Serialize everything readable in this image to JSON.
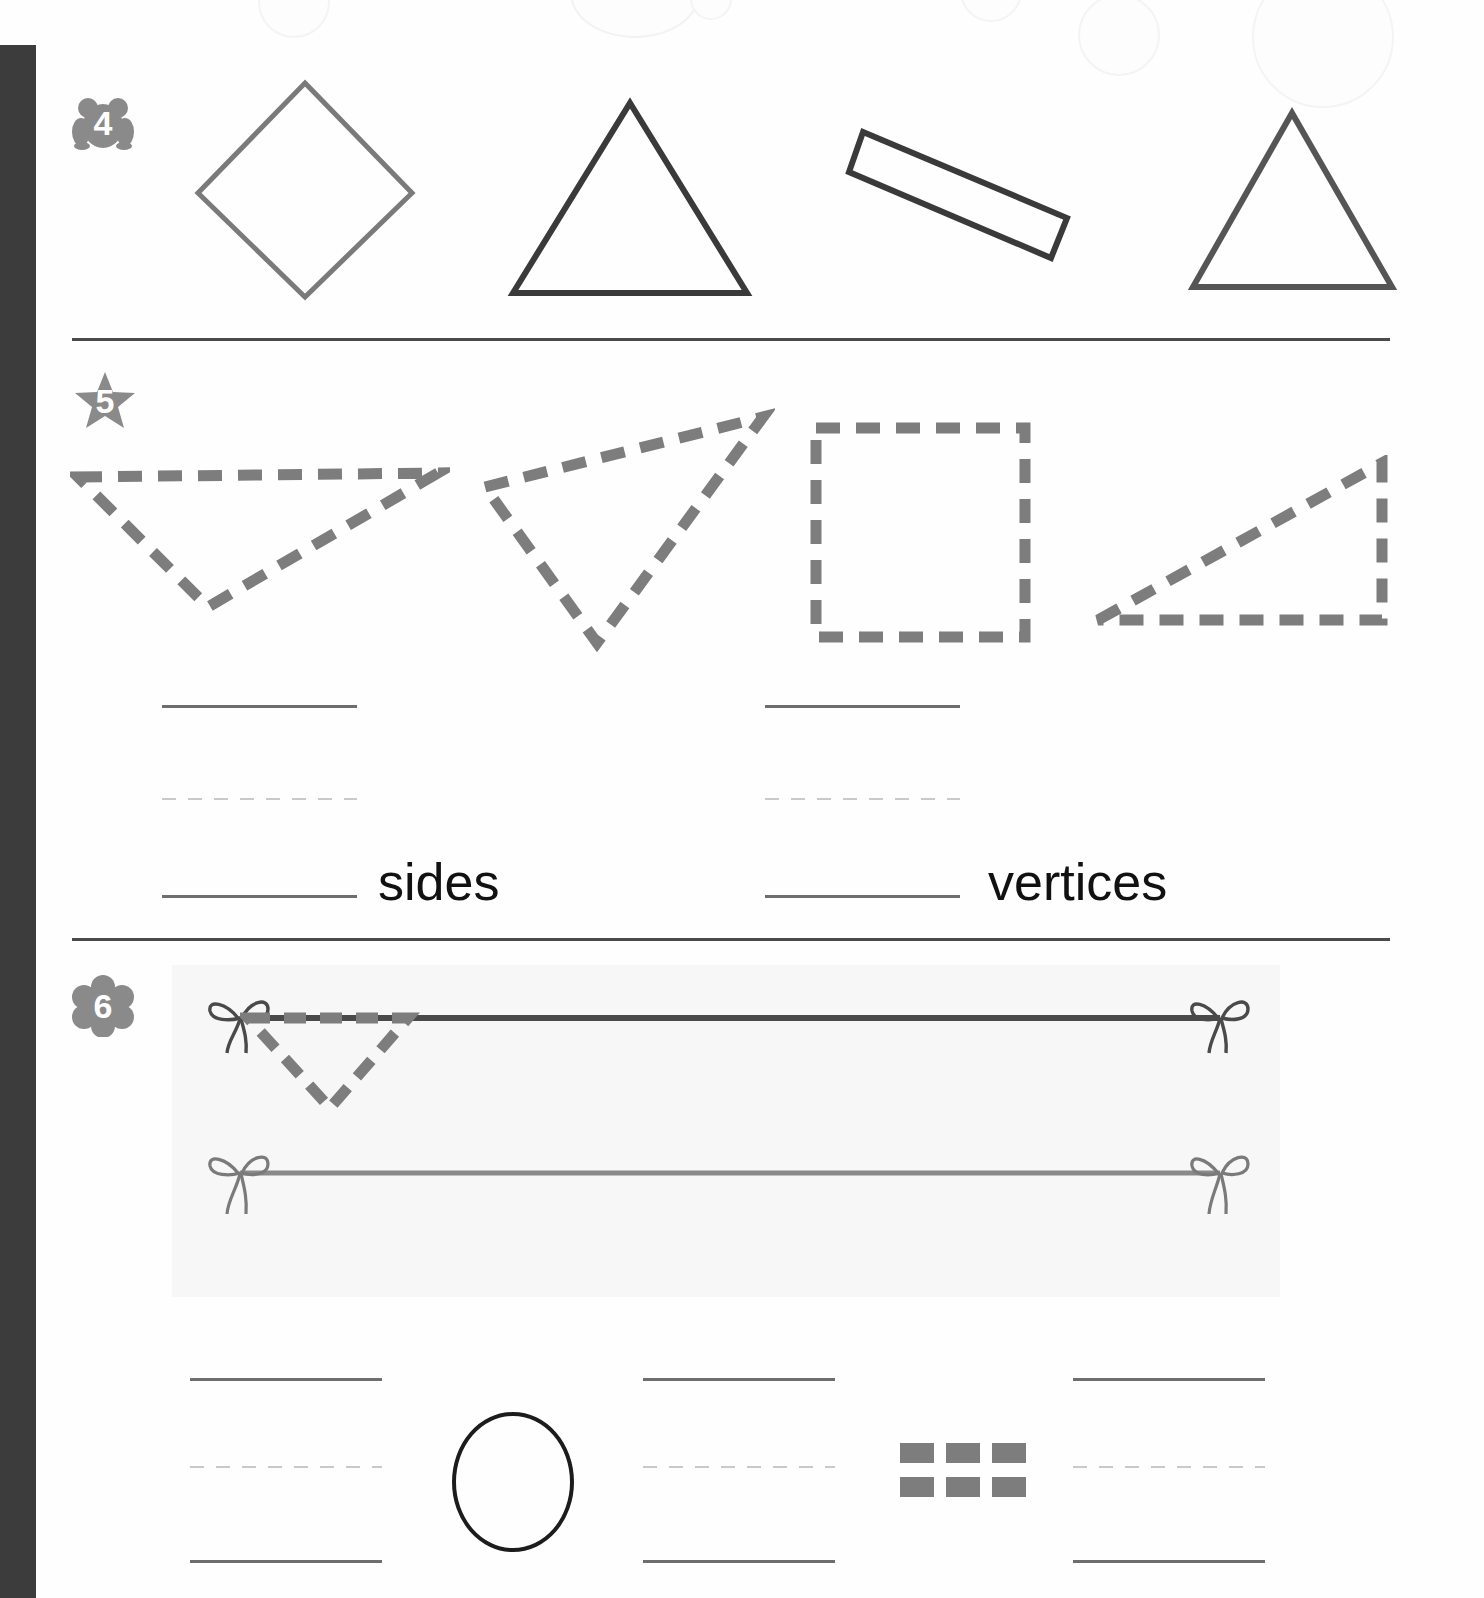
{
  "page": {
    "background_color": "#fefefe",
    "binding_color": "#3d3c3c",
    "divider_color": "#4a4a4a"
  },
  "problems": [
    {
      "number": "4",
      "badge_shape": "frog",
      "badge_color": "#8a8a8a",
      "shapes": [
        {
          "name": "diamond",
          "stroke": "#7a7a7a",
          "sides": 4,
          "vertices": 4
        },
        {
          "name": "triangle",
          "stroke": "#3a3a3a",
          "sides": 3,
          "vertices": 3
        },
        {
          "name": "rectangle-tilted",
          "stroke": "#3a3a3a",
          "sides": 4,
          "vertices": 4
        },
        {
          "name": "triangle",
          "stroke": "#555555",
          "sides": 3,
          "vertices": 3
        }
      ]
    },
    {
      "number": "5",
      "badge_shape": "star",
      "badge_color": "#8a8a8a",
      "shapes": [
        {
          "name": "dashed-triangle-wide",
          "stroke": "#7d7d7d",
          "sides": 3,
          "vertices": 3
        },
        {
          "name": "dashed-triangle-narrow",
          "stroke": "#7d7d7d",
          "sides": 3,
          "vertices": 3
        },
        {
          "name": "dashed-square",
          "stroke": "#7d7d7d",
          "sides": 4,
          "vertices": 4
        },
        {
          "name": "dashed-right-triangle",
          "stroke": "#7d7d7d",
          "sides": 3,
          "vertices": 3
        }
      ],
      "answers": [
        {
          "label": "sides",
          "value": ""
        },
        {
          "label": "vertices",
          "value": ""
        }
      ]
    },
    {
      "number": "6",
      "badge_shape": "flower",
      "badge_color": "#8a8a8a",
      "panel_color": "#f7f7f7",
      "ribbons": [
        {
          "name": "dark-ribbon",
          "color": "#4a4a4a",
          "has_bow_left": true,
          "has_bow_right": true
        },
        {
          "name": "light-ribbon",
          "color": "#8a8a8a",
          "has_bow_left": true,
          "has_bow_right": true
        }
      ],
      "hanging_shape": {
        "name": "dashed-triangle-small",
        "stroke": "#7d7d7d",
        "sides": 3,
        "vertices": 3
      },
      "answers": [
        {
          "label": "",
          "value": "",
          "glyph": "none"
        },
        {
          "label": "",
          "value": "",
          "glyph": "circle"
        },
        {
          "label": "",
          "value": "",
          "glyph": "dash-grid"
        }
      ]
    }
  ],
  "labels": {
    "sides": "sides",
    "vertices": "vertices"
  }
}
